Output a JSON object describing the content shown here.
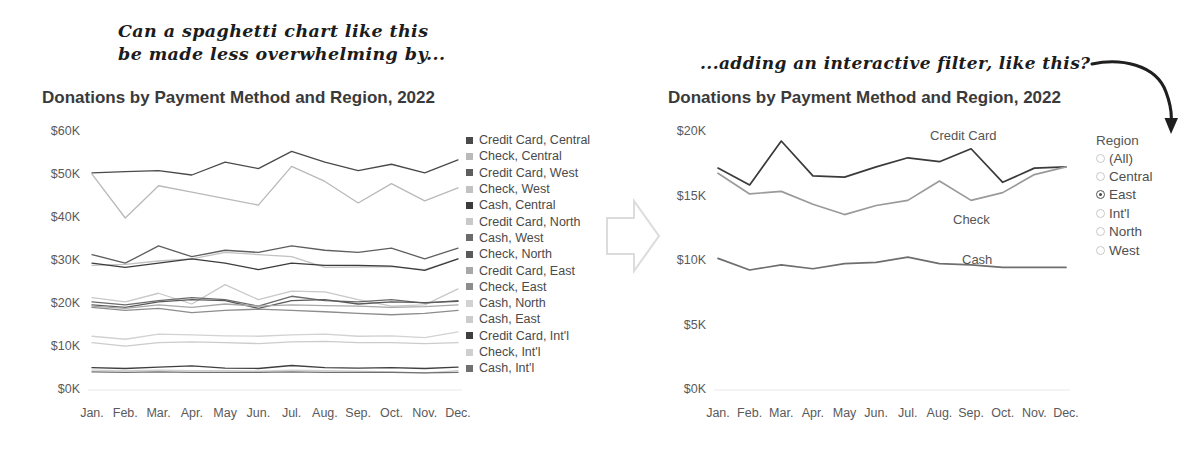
{
  "annotations": {
    "left": "Can a spaghetti chart like this\nbe made less overwhelming by...",
    "right": "...adding an interactive filter, like this?",
    "transition_arrow_icon": "right-block-arrow-icon",
    "curved_arrow_icon": "curved-down-arrow-icon"
  },
  "left_chart": {
    "title": "Donations by Payment Method and Region, 2022",
    "legend": [
      {
        "label": "Credit Card, Central",
        "color": "#4a4a4a"
      },
      {
        "label": "Check, Central",
        "color": "#b9b9b9"
      },
      {
        "label": "Credit Card, West",
        "color": "#5e5e5e"
      },
      {
        "label": "Check, West",
        "color": "#c2c2c2"
      },
      {
        "label": "Cash, Central",
        "color": "#3c3c3c"
      },
      {
        "label": "Credit Card, North",
        "color": "#c8c8c8"
      },
      {
        "label": "Cash, West",
        "color": "#6b6b6b"
      },
      {
        "label": "Check, North",
        "color": "#5a5a5a"
      },
      {
        "label": "Credit Card, East",
        "color": "#a8a8a8"
      },
      {
        "label": "Check, East",
        "color": "#8d8d8d"
      },
      {
        "label": "Cash, North",
        "color": "#d2d2d2"
      },
      {
        "label": "Cash, East",
        "color": "#cccccc"
      },
      {
        "label": "Credit Card, Int'l",
        "color": "#3f3f3f"
      },
      {
        "label": "Check, Int'l",
        "color": "#cfcfcf"
      },
      {
        "label": "Cash, Int'l",
        "color": "#707070"
      }
    ]
  },
  "right_chart": {
    "title": "Donations by Payment Method and Region, 2022",
    "series_labels": [
      {
        "name": "Credit Card",
        "x": 930,
        "y": 128
      },
      {
        "name": "Check",
        "x": 953,
        "y": 212
      },
      {
        "name": "Cash",
        "x": 962,
        "y": 252
      }
    ]
  },
  "region_filter": {
    "title": "Region",
    "options": [
      {
        "label": "(All)",
        "selected": false
      },
      {
        "label": "Central",
        "selected": false
      },
      {
        "label": "East",
        "selected": true
      },
      {
        "label": "Int'l",
        "selected": false
      },
      {
        "label": "North",
        "selected": false
      },
      {
        "label": "West",
        "selected": false
      }
    ]
  },
  "chart_data": [
    {
      "id": "left",
      "type": "line",
      "title": "Donations by Payment Method and Region, 2022",
      "xlabel": "",
      "ylabel": "",
      "ylim": [
        0,
        60000
      ],
      "yticks": [
        "$0K",
        "$10K",
        "$20K",
        "$30K",
        "$40K",
        "$50K",
        "$60K"
      ],
      "ytick_values": [
        0,
        10000,
        20000,
        30000,
        40000,
        50000,
        60000
      ],
      "grid": false,
      "legend_position": "right",
      "categories": [
        "Jan.",
        "Feb.",
        "Mar.",
        "Apr.",
        "May",
        "Jun.",
        "Jul.",
        "Aug.",
        "Sep.",
        "Oct.",
        "Nov.",
        "Dec."
      ],
      "series": [
        {
          "name": "Credit Card, Central",
          "color": "#4a4a4a",
          "values": [
            50500,
            50800,
            51000,
            50000,
            53000,
            51500,
            55500,
            53000,
            51000,
            52500,
            50500,
            53500
          ]
        },
        {
          "name": "Check, Central",
          "color": "#b9b9b9",
          "values": [
            50200,
            40000,
            47500,
            46000,
            44500,
            43000,
            52000,
            48500,
            43500,
            48000,
            44000,
            47000
          ]
        },
        {
          "name": "Credit Card, West",
          "color": "#5e5e5e",
          "values": [
            31500,
            29500,
            33500,
            31000,
            32500,
            32000,
            33500,
            32500,
            32000,
            33000,
            30500,
            33000
          ]
        },
        {
          "name": "Check, West",
          "color": "#c2c2c2",
          "values": [
            29000,
            29200,
            30000,
            30500,
            32000,
            31500,
            31000,
            28500,
            28600,
            28700,
            28000,
            30500
          ]
        },
        {
          "name": "Cash, Central",
          "color": "#3c3c3c",
          "values": [
            29500,
            28500,
            29500,
            30500,
            29500,
            28000,
            29500,
            29000,
            29000,
            28800,
            27800,
            30500
          ]
        },
        {
          "name": "Credit Card, North",
          "color": "#c8c8c8",
          "values": [
            21500,
            20500,
            22500,
            20000,
            24500,
            21000,
            23000,
            22800,
            21000,
            19500,
            19800,
            23500
          ]
        },
        {
          "name": "Cash, West",
          "color": "#6b6b6b",
          "values": [
            20500,
            19800,
            20800,
            21500,
            21000,
            19500,
            21800,
            20800,
            20500,
            21000,
            20200,
            20800
          ]
        },
        {
          "name": "Check, North",
          "color": "#5a5a5a",
          "values": [
            19800,
            19200,
            20500,
            21000,
            20800,
            19000,
            20800,
            21000,
            20000,
            20500,
            20300,
            20600
          ]
        },
        {
          "name": "Credit Card, East",
          "color": "#a8a8a8",
          "values": [
            19500,
            19000,
            19800,
            19200,
            20000,
            19500,
            19800,
            19600,
            19500,
            19200,
            19400,
            19800
          ]
        },
        {
          "name": "Check, East",
          "color": "#8d8d8d",
          "values": [
            19200,
            18500,
            19000,
            18000,
            18500,
            18800,
            18500,
            18200,
            17800,
            17500,
            17800,
            18500
          ]
        },
        {
          "name": "Cash, North",
          "color": "#d2d2d2",
          "values": [
            12500,
            11800,
            13000,
            12800,
            12600,
            12500,
            12800,
            13000,
            12500,
            12600,
            12200,
            13500
          ]
        },
        {
          "name": "Cash, East",
          "color": "#cccccc",
          "values": [
            11000,
            10200,
            11000,
            11200,
            11000,
            10800,
            11200,
            11300,
            11000,
            11000,
            10800,
            11000
          ]
        },
        {
          "name": "Credit Card, Int'l",
          "color": "#3f3f3f",
          "values": [
            5200,
            5000,
            5300,
            5600,
            5100,
            5000,
            5700,
            5200,
            5100,
            5200,
            5000,
            5300
          ]
        },
        {
          "name": "Check, Int'l",
          "color": "#cfcfcf",
          "values": [
            4600,
            4500,
            4600,
            4500,
            4500,
            4400,
            4600,
            4500,
            4400,
            4200,
            4000,
            4500
          ]
        },
        {
          "name": "Cash, Int'l",
          "color": "#707070",
          "values": [
            4200,
            4100,
            4200,
            4100,
            4100,
            4100,
            4200,
            4100,
            4100,
            4100,
            4000,
            4100
          ]
        }
      ]
    },
    {
      "id": "right",
      "type": "line",
      "title": "Donations by Payment Method and Region, 2022",
      "xlabel": "",
      "ylabel": "",
      "ylim": [
        0,
        20000
      ],
      "yticks": [
        "$0K",
        "$5K",
        "$10K",
        "$15K",
        "$20K"
      ],
      "ytick_values": [
        0,
        5000,
        10000,
        15000,
        20000
      ],
      "grid": false,
      "legend_position": "inline-labels",
      "filtered_region": "East",
      "categories": [
        "Jan.",
        "Feb.",
        "Mar.",
        "Apr.",
        "May",
        "Jun.",
        "Jul.",
        "Aug.",
        "Sep.",
        "Oct.",
        "Nov.",
        "Dec."
      ],
      "series": [
        {
          "name": "Credit Card",
          "color": "#3a3a3a",
          "values": [
            17200,
            15900,
            19300,
            16600,
            16500,
            17300,
            18000,
            17700,
            18700,
            16100,
            17200,
            17300
          ]
        },
        {
          "name": "Check",
          "color": "#9a9a9a",
          "values": [
            16800,
            15200,
            15400,
            14400,
            13600,
            14300,
            14700,
            16200,
            14700,
            15300,
            16700,
            17300
          ]
        },
        {
          "name": "Cash",
          "color": "#6e6e6e",
          "values": [
            10200,
            9300,
            9700,
            9400,
            9800,
            9900,
            10300,
            9800,
            9700,
            9500,
            9500,
            9500
          ]
        }
      ]
    }
  ]
}
